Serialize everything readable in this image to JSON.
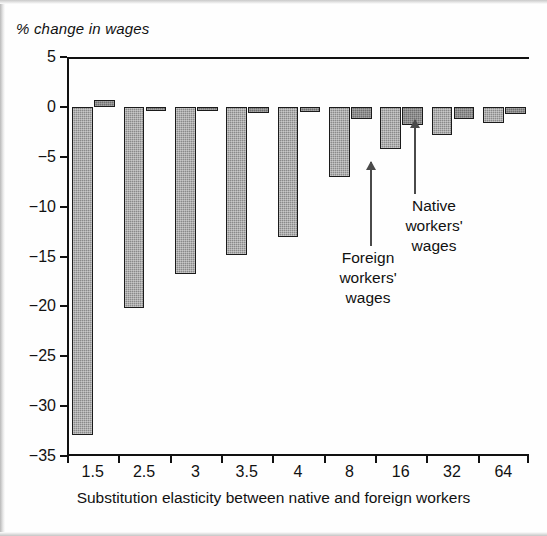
{
  "figure": {
    "y_axis_title": "% change in wages",
    "x_axis_title": "Substitution elasticity between native and foreign workers"
  },
  "annotations": {
    "native": "Native\nworkers'\nwages",
    "foreign": "Foreign\nworkers'\nwages"
  },
  "chart_data": {
    "type": "bar",
    "title": "",
    "xlabel": "Substitution elasticity between native and foreign workers",
    "ylabel": "% change in wages",
    "ylim": [
      -35,
      5
    ],
    "yticks": [
      5,
      0,
      -5,
      -10,
      -15,
      -20,
      -25,
      -30,
      -35
    ],
    "ytick_labels": [
      "5",
      "0",
      "−5",
      "−10",
      "−15",
      "−20",
      "−25",
      "−30",
      "−35"
    ],
    "grid": false,
    "legend": "annotated-arrows",
    "categories": [
      "1.5",
      "2.5",
      "3",
      "3.5",
      "4",
      "8",
      "16",
      "32",
      "64"
    ],
    "series": [
      {
        "name": "Foreign workers' wages",
        "color": "#8a8a8a",
        "values": [
          -32.9,
          -20.2,
          -16.8,
          -14.8,
          -13.0,
          -7.0,
          -4.2,
          -2.8,
          -1.6
        ]
      },
      {
        "name": "Native workers' wages",
        "color": "#6f6f6f",
        "values": [
          0.7,
          -0.2,
          -0.3,
          -0.6,
          -0.5,
          -1.2,
          -1.8,
          -1.2,
          -0.7
        ]
      }
    ]
  }
}
